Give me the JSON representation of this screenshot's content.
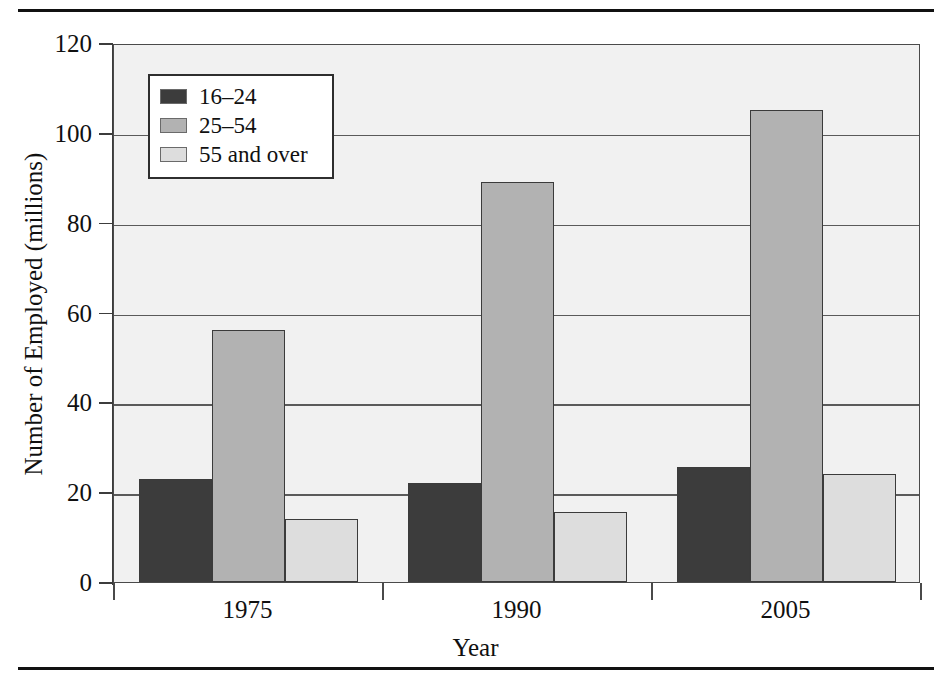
{
  "chart_data": {
    "type": "bar",
    "title": "",
    "xlabel": "Year",
    "ylabel": "Number of Employed (millions)",
    "categories": [
      "1975",
      "1990",
      "2005"
    ],
    "series": [
      {
        "name": "16–24",
        "color": "#3c3c3c",
        "values": [
          23,
          22,
          25.5
        ]
      },
      {
        "name": "25–54",
        "color": "#b2b2b2",
        "values": [
          56,
          89,
          105
        ]
      },
      {
        "name": "55 and over",
        "color": "#dddddd",
        "values": [
          14,
          15.5,
          24
        ]
      }
    ],
    "ylim": [
      0,
      120
    ],
    "ytick_labels": [
      "0",
      "20",
      "40",
      "60",
      "80",
      "100",
      "120"
    ],
    "ytick_values": [
      0,
      20,
      40,
      60,
      80,
      100,
      120
    ],
    "grid": true,
    "legend_position": "upper-left-inside",
    "plot_background": "#f1f1f1",
    "axis_color": "#3c3c3c"
  },
  "legend": {
    "items": [
      {
        "label": "16–24"
      },
      {
        "label": "25–54"
      },
      {
        "label": "55 and over"
      }
    ]
  },
  "axes": {
    "y_title": "Number of Employed (millions)",
    "x_title": "Year"
  }
}
